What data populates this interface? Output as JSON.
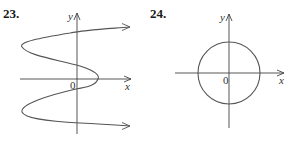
{
  "figures": [
    {
      "label": "23.",
      "x_label": "x",
      "y_label": "y",
      "origin_label": "0",
      "description": "Sideways S-shaped curve (x as a function of y) with arrows pointing right at both ends",
      "stroke_color": "#555555",
      "axis_color": "#444444"
    },
    {
      "label": "24.",
      "x_label": "x",
      "y_label": "y",
      "origin_label": "0",
      "description": "Circle centered at the origin",
      "stroke_color": "#555555",
      "axis_color": "#444444"
    }
  ]
}
